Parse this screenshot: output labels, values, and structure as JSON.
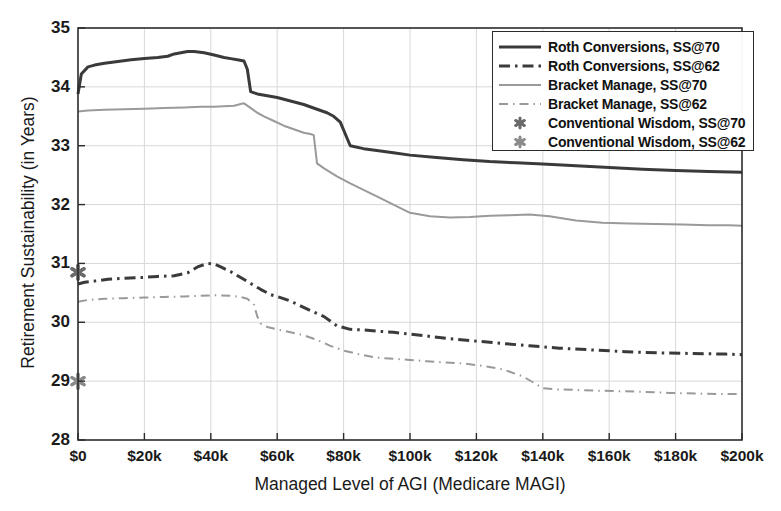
{
  "chart_data": {
    "type": "line",
    "title": "",
    "xlabel": "Managed Level of AGI (Medicare MAGI)",
    "ylabel": "Retirement Sustainability (in Years)",
    "xlim": [
      0,
      200
    ],
    "ylim": [
      28,
      35
    ],
    "grid": true,
    "x_unit": "thousand dollars",
    "xticks": [
      0,
      20,
      40,
      60,
      80,
      100,
      120,
      140,
      160,
      180,
      200
    ],
    "xtick_labels": [
      "$0",
      "$20k",
      "$40k",
      "$60k",
      "$80k",
      "$100k",
      "$120k",
      "$140k",
      "$160k",
      "$180k",
      "$200k"
    ],
    "yticks": [
      28,
      29,
      30,
      31,
      32,
      33,
      34,
      35
    ],
    "ytick_labels": [
      "28",
      "29",
      "30",
      "31",
      "32",
      "33",
      "34",
      "35"
    ],
    "legend_position": "upper right",
    "colors": {
      "dark": "#3a3a3a",
      "gray": "#9a9a9a",
      "axis": "#2b2b2b",
      "grid": "#d8d8d8"
    },
    "series": [
      {
        "name": "Roth Conversions, SS@70",
        "style": "solid",
        "color": "#3a3a3a",
        "width": 3.0,
        "x": [
          0,
          1,
          3,
          5,
          8,
          12,
          16,
          20,
          24,
          27,
          29,
          31,
          33,
          35,
          38,
          41,
          44,
          46,
          48,
          50,
          51,
          52,
          54,
          57,
          60,
          64,
          68,
          72,
          75,
          77,
          79,
          82,
          86,
          90,
          95,
          100,
          108,
          116,
          124,
          132,
          140,
          150,
          160,
          170,
          180,
          190,
          200
        ],
        "y": [
          33.88,
          34.22,
          34.34,
          34.37,
          34.4,
          34.43,
          34.46,
          34.48,
          34.5,
          34.52,
          34.56,
          34.58,
          34.6,
          34.6,
          34.58,
          34.54,
          34.5,
          34.48,
          34.46,
          34.44,
          34.3,
          33.92,
          33.88,
          33.85,
          33.82,
          33.76,
          33.7,
          33.62,
          33.56,
          33.5,
          33.4,
          33.0,
          32.95,
          32.92,
          32.88,
          32.84,
          32.8,
          32.76,
          32.73,
          32.71,
          32.69,
          32.66,
          32.63,
          32.6,
          32.58,
          32.56,
          32.55
        ]
      },
      {
        "name": "Roth Conversions, SS@62",
        "style": "dashdot",
        "color": "#3a3a3a",
        "width": 3.0,
        "x": [
          0,
          2,
          5,
          9,
          14,
          19,
          24,
          29,
          33,
          36,
          39,
          41,
          43,
          46,
          49,
          52,
          55,
          58,
          61,
          64,
          67,
          70,
          74,
          78,
          82,
          86,
          90,
          95,
          100,
          106,
          112,
          120,
          128,
          136,
          145,
          155,
          165,
          175,
          185,
          195,
          200
        ],
        "y": [
          30.65,
          30.68,
          30.7,
          30.73,
          30.75,
          30.76,
          30.78,
          30.79,
          30.84,
          30.94,
          31.0,
          30.99,
          30.94,
          30.86,
          30.76,
          30.66,
          30.56,
          30.47,
          30.42,
          30.36,
          30.28,
          30.2,
          30.1,
          29.94,
          29.88,
          29.87,
          29.85,
          29.83,
          29.8,
          29.76,
          29.72,
          29.68,
          29.64,
          29.6,
          29.56,
          29.53,
          29.5,
          29.48,
          29.47,
          29.46,
          29.45
        ]
      },
      {
        "name": "Bracket Manage, SS@70",
        "style": "solid",
        "color": "#9a9a9a",
        "width": 2.0,
        "x": [
          0,
          3,
          8,
          14,
          20,
          26,
          32,
          37,
          41,
          44,
          47,
          49,
          50,
          51,
          53,
          54,
          56,
          59,
          62,
          65,
          68,
          70,
          71,
          72,
          74,
          78,
          82,
          86,
          90,
          95,
          100,
          106,
          112,
          118,
          124,
          130,
          136,
          142,
          150,
          158,
          166,
          174,
          182,
          190,
          196,
          200
        ],
        "y": [
          33.58,
          33.6,
          33.61,
          33.62,
          33.63,
          33.64,
          33.65,
          33.66,
          33.66,
          33.67,
          33.68,
          33.71,
          33.72,
          33.68,
          33.6,
          33.56,
          33.5,
          33.42,
          33.34,
          33.28,
          33.22,
          33.2,
          33.18,
          32.7,
          32.62,
          32.48,
          32.36,
          32.25,
          32.14,
          32.0,
          31.86,
          31.8,
          31.78,
          31.79,
          31.81,
          31.82,
          31.83,
          31.8,
          31.73,
          31.69,
          31.68,
          31.67,
          31.66,
          31.65,
          31.65,
          31.64
        ]
      },
      {
        "name": "Bracket Manage, SS@62",
        "style": "dashdot",
        "color": "#9a9a9a",
        "width": 2.0,
        "x": [
          0,
          3,
          8,
          14,
          20,
          26,
          32,
          37,
          42,
          46,
          49,
          51,
          53,
          54,
          55,
          57,
          60,
          64,
          68,
          72,
          76,
          80,
          85,
          90,
          95,
          100,
          105,
          110,
          116,
          122,
          128,
          134,
          138,
          140,
          144,
          150,
          156,
          162,
          170,
          178,
          186,
          194,
          200
        ],
        "y": [
          30.35,
          30.38,
          30.4,
          30.41,
          30.42,
          30.43,
          30.44,
          30.45,
          30.46,
          30.45,
          30.43,
          30.4,
          30.3,
          30.1,
          29.98,
          29.92,
          29.88,
          29.83,
          29.78,
          29.7,
          29.6,
          29.52,
          29.45,
          29.4,
          29.38,
          29.36,
          29.34,
          29.32,
          29.3,
          29.26,
          29.2,
          29.08,
          28.95,
          28.88,
          28.86,
          28.85,
          28.84,
          28.83,
          28.82,
          28.8,
          28.79,
          28.78,
          28.78
        ]
      }
    ],
    "markers": [
      {
        "name": "Conventional Wisdom, SS@70",
        "symbol": "asterisk",
        "color": "#6a6a6a",
        "x": 0,
        "y": 30.85
      },
      {
        "name": "Conventional Wisdom, SS@62",
        "symbol": "asterisk",
        "color": "#8a8a8a",
        "x": 0,
        "y": 29.0
      }
    ],
    "legend": [
      {
        "label": "Roth Conversions, SS@70",
        "style": "solid",
        "color": "#3a3a3a",
        "width": 3.0
      },
      {
        "label": "Roth Conversions, SS@62",
        "style": "dashdot",
        "color": "#3a3a3a",
        "width": 3.0
      },
      {
        "label": "Bracket Manage, SS@70",
        "style": "solid",
        "color": "#9a9a9a",
        "width": 2.0
      },
      {
        "label": "Bracket Manage, SS@62",
        "style": "dashdot",
        "color": "#9a9a9a",
        "width": 2.0
      },
      {
        "label": "Conventional Wisdom, SS@70",
        "style": "asterisk",
        "color": "#6a6a6a",
        "width": 0
      },
      {
        "label": "Conventional Wisdom, SS@62",
        "style": "asterisk",
        "color": "#8a8a8a",
        "width": 0
      }
    ]
  }
}
